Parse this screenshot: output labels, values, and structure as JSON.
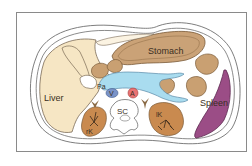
{
  "diagram": {
    "labels": {
      "liver": "Liver",
      "stomach": "Stomach",
      "spleen": "Spleen",
      "pancreas": "Pa",
      "vein": "V",
      "aorta": "A",
      "spinal_canal": "SC",
      "left_kidney": "lK",
      "right_kidney": "rK"
    },
    "colors": {
      "liver": "#f6e6c4",
      "stomach": "#caa277",
      "bowel": "#c9a072",
      "spleen": "#9b4d86",
      "pancreas": "#a9dcef",
      "vein": "#7a93c8",
      "aorta": "#ea7373",
      "kidney": "#c98a4f",
      "outline": "#6f6f6f",
      "adrenal": "#8a6a45"
    }
  }
}
